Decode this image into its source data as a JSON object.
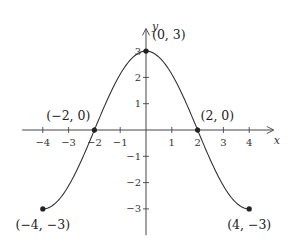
{
  "chart_data": {
    "type": "line",
    "title": "",
    "xlabel": "x",
    "ylabel": "y",
    "xlim": [
      -4.8,
      4.8
    ],
    "ylim": [
      -4.0,
      3.9
    ],
    "grid": false,
    "function": "3cos(pi*x/4)",
    "domain": [
      -4,
      4
    ],
    "x_ticks": [
      -4,
      -3,
      -2,
      -1,
      1,
      2,
      3,
      4
    ],
    "x_tick_labels": [
      "−4",
      "−3",
      "−2",
      "−1",
      "1",
      "2",
      "3",
      "4"
    ],
    "y_ticks": [
      3,
      2,
      1,
      -1,
      -2,
      -3
    ],
    "y_tick_labels": [
      "3",
      "2",
      "1",
      "−1",
      "−2",
      "−3"
    ],
    "series": [
      {
        "name": "f",
        "x": [
          -4,
          -3,
          -2,
          -1,
          0,
          1,
          2,
          3,
          4
        ],
        "y": [
          -3,
          -2.12,
          0,
          2.12,
          3,
          2.12,
          0,
          -2.12,
          -3
        ]
      }
    ],
    "points": [
      {
        "x": -4,
        "y": -3,
        "label": "(−4, −3)",
        "pos": "below"
      },
      {
        "x": -2,
        "y": 0,
        "label": "(−2, 0)",
        "pos": "above-left"
      },
      {
        "x": 0,
        "y": 3,
        "label": "(0, 3)",
        "pos": "above-right"
      },
      {
        "x": 2,
        "y": 0,
        "label": "(2, 0)",
        "pos": "above-right"
      },
      {
        "x": 4,
        "y": -3,
        "label": "(4, −3)",
        "pos": "below"
      }
    ]
  }
}
